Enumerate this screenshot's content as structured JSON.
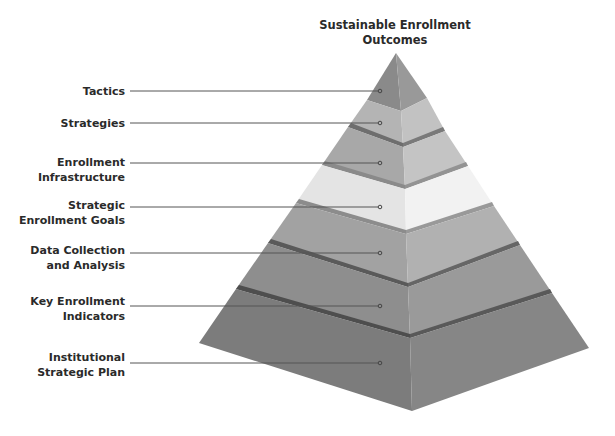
{
  "title": {
    "line1": "Sustainable Enrollment",
    "line2": "Outcomes"
  },
  "tiers": [
    {
      "label_lines": [
        "Tactics"
      ],
      "level": 7,
      "color": "#8e8e8e"
    },
    {
      "label_lines": [
        "Strategies"
      ],
      "level": 6,
      "color": "#b8b8b8"
    },
    {
      "label_lines": [
        "Enrollment",
        "Infrastructure"
      ],
      "level": 5,
      "color": "#a9a9a9"
    },
    {
      "label_lines": [
        "Strategic",
        "Enrollment Goals"
      ],
      "level": 4,
      "color": "#e6e6e6"
    },
    {
      "label_lines": [
        "Data Collection",
        "and Analysis"
      ],
      "level": 3,
      "color": "#a4a4a4"
    },
    {
      "label_lines": [
        "Key Enrollment",
        "Indicators"
      ],
      "level": 2,
      "color": "#8f8f8f"
    },
    {
      "label_lines": [
        "Institutional",
        "Strategic Plan"
      ],
      "level": 1,
      "color": "#7c7c7c"
    }
  ],
  "colors": {
    "text": "#2a2a2a",
    "leader_line": "#555555",
    "band_shadow": "#5e5e5e"
  }
}
